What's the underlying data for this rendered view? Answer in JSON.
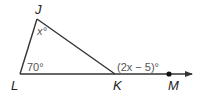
{
  "diagram": {
    "type": "triangle-exterior-angle",
    "vertices": {
      "J": {
        "label": "J",
        "x": 37,
        "y": 19
      },
      "L": {
        "label": "L",
        "x": 20,
        "y": 74
      },
      "K": {
        "label": "K",
        "x": 115,
        "y": 74
      }
    },
    "point_M": {
      "label": "M",
      "x": 169,
      "y": 74
    },
    "ray_end": {
      "x": 192,
      "y": 74
    },
    "angles": {
      "J": "x°",
      "L": "70°",
      "K_exterior": "(2x − 5)°"
    },
    "colors": {
      "line": "#333333",
      "label": "#222222",
      "angle_text": "#555555"
    }
  }
}
